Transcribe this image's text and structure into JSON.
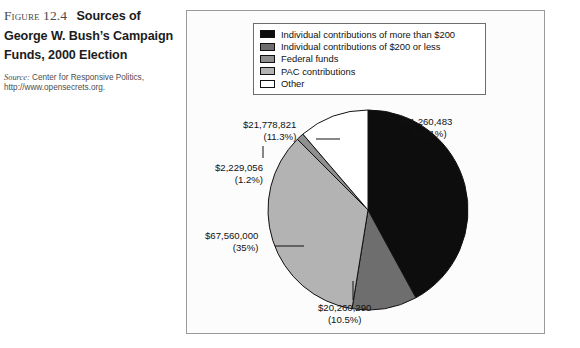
{
  "figure": {
    "label": "Figure 12.4",
    "title_line1": "Sources of",
    "title_line2": "George W. Bush’s Campaign",
    "title_line3": "Funds, 2000 Election",
    "source_word": "Source:",
    "source_text": " Center for Responsive Politics,",
    "source_url": "http://www.opensecrets.org."
  },
  "legend": {
    "items": [
      {
        "label": "Individual contributions of more than $200",
        "color": "#0d0d0d"
      },
      {
        "label": "Individual contributions of $200 or less",
        "color": "#6e6e6e"
      },
      {
        "label": "Federal funds",
        "color": "#8f8f8f"
      },
      {
        "label": "PAC contributions",
        "color": "#b3b3b3"
      },
      {
        "label": "Other",
        "color": "#ffffff"
      }
    ]
  },
  "chart_data": {
    "type": "pie",
    "title": "Sources of George W. Bush’s Campaign Funds, 2000 Election",
    "start_angle_deg": 0,
    "direction": "clockwise",
    "center": {
      "x": 181,
      "y": 199
    },
    "radius": 100,
    "categories": [
      "Individual contributions of more than $200",
      "Individual contributions of $200 or less",
      "Federal funds",
      "PAC contributions",
      "Other"
    ],
    "values": [
      81260483,
      20260290,
      67560000,
      2229056,
      21778821
    ],
    "percents": [
      42.1,
      10.5,
      35,
      1.2,
      11.3
    ],
    "colors": [
      "#0d0d0d",
      "#6e6e6e",
      "#b3b3b3",
      "#8f8f8f",
      "#ffffff"
    ],
    "slices": [
      {
        "name": "Individual contributions of more than $200",
        "amount": 81260483,
        "amount_text": "$81,260,483",
        "percent": 42.1,
        "percent_text": "(42.1%)",
        "color": "#0d0d0d",
        "label_x": 212,
        "label_y": 105,
        "label_align": "right",
        "leader": {
          "x1": 226,
          "y1": 125,
          "x2": 243,
          "y2": 125
        }
      },
      {
        "name": "Individual contributions of $200 or less",
        "amount": 20260290,
        "amount_text": "$20,260,290",
        "percent": 10.5,
        "percent_text": "(10.5%)",
        "color": "#6e6e6e",
        "label_x": 131,
        "label_y": 291,
        "label_align": "center",
        "leader": {
          "x1": 166,
          "y1": 270,
          "x2": 166,
          "y2": 289
        }
      },
      {
        "name": "Federal funds",
        "amount": 67560000,
        "amount_text": "$67,560,000",
        "percent": 35,
        "percent_text": "(35%)",
        "color": "#b3b3b3",
        "label_x": 18,
        "label_y": 219,
        "label_align": "left",
        "leader": {
          "x1": 88,
          "y1": 235,
          "x2": 117,
          "y2": 235
        }
      },
      {
        "name": "PAC contributions",
        "amount": 2229056,
        "amount_text": "$2,229,056",
        "percent": 1.2,
        "percent_text": "(1.2%)",
        "color": "#8f8f8f",
        "label_x": 28,
        "label_y": 151,
        "label_align": "left",
        "leader": {
          "x1": 76,
          "y1": 147,
          "x2": 76,
          "y2": 135
        }
      },
      {
        "name": "Other",
        "amount": 21778821,
        "amount_text": "$21,778,821",
        "percent": 11.3,
        "percent_text": "(11.3%)",
        "color": "#ffffff",
        "label_x": 56,
        "label_y": 108,
        "label_align": "left",
        "leader": {
          "x1": 129,
          "y1": 128,
          "x2": 153,
          "y2": 128
        }
      }
    ]
  }
}
